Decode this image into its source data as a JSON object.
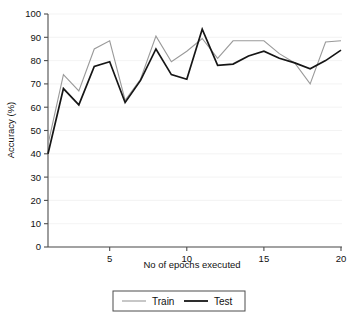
{
  "chart_data": {
    "type": "line",
    "title": "",
    "xlabel": "No of epochs executed",
    "ylabel": "Accuracy (%)",
    "xlim": [
      1,
      20
    ],
    "ylim": [
      0,
      100
    ],
    "xticks": [
      5,
      10,
      15,
      20
    ],
    "yticks": [
      0,
      10,
      20,
      30,
      40,
      50,
      60,
      70,
      80,
      90,
      100
    ],
    "grid": true,
    "legend_position": "bottom-center",
    "x": [
      1,
      2,
      3,
      4,
      5,
      6,
      7,
      8,
      9,
      10,
      11,
      12,
      13,
      14,
      15,
      16,
      17,
      18,
      19,
      20
    ],
    "series": [
      {
        "name": "Train",
        "color": "#9a9a9a",
        "linewidth": 1.1,
        "values": [
          44,
          74,
          67,
          85,
          88.5,
          63,
          72,
          90.5,
          79.5,
          84,
          89.5,
          81,
          88.5,
          88.5,
          88.5,
          83,
          79,
          70,
          88,
          88.5
        ]
      },
      {
        "name": "Test",
        "color": "#161616",
        "linewidth": 1.7,
        "values": [
          40,
          68,
          61,
          77.5,
          79.5,
          62,
          71.5,
          85,
          74,
          72,
          93.5,
          78,
          78.5,
          82,
          84,
          81,
          79,
          76.5,
          80,
          84.5
        ]
      }
    ]
  },
  "axes": {
    "y_tick_labels": [
      "0",
      "10",
      "20",
      "30",
      "40",
      "50",
      "60",
      "70",
      "80",
      "90",
      "100"
    ],
    "x_tick_labels": [
      "5",
      "10",
      "15",
      "20"
    ],
    "x_axis_title": "No of epochs executed",
    "y_axis_title": "Accuracy (%)"
  },
  "legend": {
    "entries": [
      {
        "label": "Train",
        "color": "#9a9a9a"
      },
      {
        "label": "Test",
        "color": "#161616"
      }
    ]
  }
}
